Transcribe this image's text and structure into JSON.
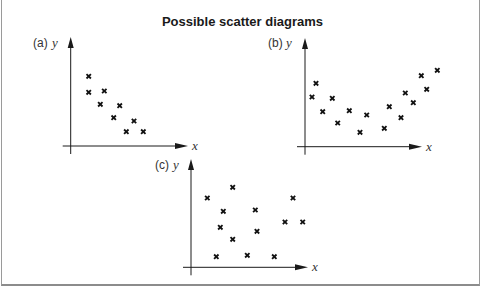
{
  "title": "Possible scatter diagrams",
  "colors": {
    "axis": "#1a1a1a",
    "marker": "#111111",
    "text": "#333333",
    "frame": "#9a9a9a"
  },
  "chart_data": [
    {
      "type": "scatter",
      "panel": "(a)",
      "xlabel": "x",
      "ylabel": "y",
      "description": "negative correlation",
      "axes_px": {
        "origin": [
          70.7,
          146
        ],
        "x_end": 188,
        "y_end": 37
      },
      "label_px": {
        "panel": [
          33,
          47
        ],
        "y": [
          52,
          47
        ],
        "x": [
          192,
          150
        ]
      },
      "points_px": [
        [
          88.7,
          76.3
        ],
        [
          88.7,
          92.3
        ],
        [
          104.3,
          91
        ],
        [
          100.3,
          104.3
        ],
        [
          119.7,
          105.7
        ],
        [
          113.7,
          117.7
        ],
        [
          134,
          121
        ],
        [
          126.3,
          131.7
        ],
        [
          143.3,
          131.7
        ]
      ]
    },
    {
      "type": "scatter",
      "panel": "(b)",
      "xlabel": "x",
      "ylabel": "y",
      "description": "non-linear (U-shaped) relationship",
      "axes_px": {
        "origin": [
          305,
          146.7
        ],
        "x_end": 422,
        "y_end": 38
      },
      "label_px": {
        "panel": [
          268,
          47
        ],
        "y": [
          286,
          47
        ],
        "x": [
          426,
          151
        ]
      },
      "points_px": [
        [
          316,
          83.3
        ],
        [
          312,
          97
        ],
        [
          332.3,
          98.3
        ],
        [
          322.7,
          111.7
        ],
        [
          349.3,
          110.7
        ],
        [
          337.7,
          123
        ],
        [
          366.7,
          115
        ],
        [
          360,
          132.3
        ],
        [
          384.3,
          128.3
        ],
        [
          389.3,
          106.7
        ],
        [
          401,
          117.7
        ],
        [
          405.3,
          93
        ],
        [
          413.3,
          102.7
        ],
        [
          421.3,
          75.7
        ],
        [
          426.7,
          89.3
        ],
        [
          437.3,
          70.3
        ]
      ]
    },
    {
      "type": "scatter",
      "panel": "(c)",
      "xlabel": "x",
      "ylabel": "y",
      "description": "no correlation",
      "axes_px": {
        "origin": [
          191,
          267.3
        ],
        "x_end": 308,
        "y_end": 159
      },
      "label_px": {
        "panel": [
          155,
          169
        ],
        "y": [
          173,
          169
        ],
        "x": [
          312,
          271
        ]
      },
      "points_px": [
        [
          232.7,
          187.3
        ],
        [
          207.3,
          198
        ],
        [
          223.3,
          211.3
        ],
        [
          255.3,
          210
        ],
        [
          293,
          198
        ],
        [
          220.3,
          227.3
        ],
        [
          285,
          222
        ],
        [
          302.7,
          222
        ],
        [
          257,
          231.3
        ],
        [
          232.7,
          239.3
        ],
        [
          216.3,
          256.7
        ],
        [
          247.3,
          255.3
        ],
        [
          274.3,
          256.7
        ]
      ]
    }
  ]
}
